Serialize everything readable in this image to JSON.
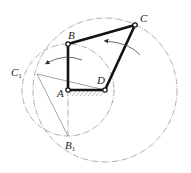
{
  "diagram": {
    "type": "four-bar-linkage",
    "labels": {
      "A": "A",
      "B": "B",
      "C": "C",
      "D": "D",
      "C1": "C",
      "C1_sub": "1",
      "B1": "B",
      "B1_sub": "1"
    },
    "points": {
      "A": [
        68,
        90
      ],
      "B": [
        68,
        44
      ],
      "C": [
        135,
        25
      ],
      "D": [
        105,
        90
      ],
      "C1": [
        37,
        74
      ],
      "B1": [
        68,
        136
      ]
    },
    "links": [
      {
        "from": "A",
        "to": "B",
        "style": "bold"
      },
      {
        "from": "B",
        "to": "C",
        "style": "bold"
      },
      {
        "from": "C",
        "to": "D",
        "style": "bold"
      },
      {
        "from": "A",
        "to": "D",
        "style": "bold-ground"
      }
    ],
    "construction_lines": [
      {
        "from": "C1",
        "to": "D"
      },
      {
        "from": "C1",
        "to": "B1"
      },
      {
        "from": "A",
        "to": "B1"
      }
    ],
    "circles": [
      {
        "center": "A",
        "radius": 46,
        "style": "dash-dot"
      },
      {
        "center": "D",
        "radius": 72,
        "style": "dash-dot"
      }
    ],
    "rotation_arrows": [
      {
        "near": "C",
        "direction": "counterclockwise"
      },
      {
        "near": "B",
        "direction": "counterclockwise"
      }
    ],
    "colors": {
      "link": "#111111",
      "construction": "#8a8a8a",
      "background": "#ffffff"
    }
  }
}
